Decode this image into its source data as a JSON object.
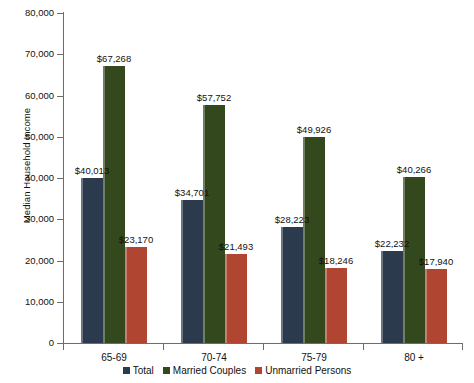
{
  "chart_data": {
    "type": "bar",
    "title": "",
    "xlabel": "",
    "ylabel": "Median Household Income",
    "categories": [
      "65-69",
      "70-74",
      "75-79",
      "80 +"
    ],
    "ylim": [
      0,
      80000
    ],
    "ytick_values": [
      0,
      10000,
      20000,
      30000,
      40000,
      50000,
      60000,
      70000,
      80000
    ],
    "ytick_labels": [
      "0",
      "10,000",
      "20,000",
      "30,000",
      "40,000",
      "50,000",
      "60,000",
      "70,000",
      "80,000"
    ],
    "grid": false,
    "legend_position": "bottom",
    "series": [
      {
        "name": "Total",
        "color": "#2c3a4d",
        "values": [
          40013,
          34701,
          28223,
          22232
        ],
        "labels": [
          "$40,013",
          "$34,701",
          "$28,223",
          "$22,232"
        ]
      },
      {
        "name": "Married Couples",
        "color": "#34481e",
        "values": [
          67268,
          57752,
          49926,
          40266
        ],
        "labels": [
          "$67,268",
          "$57,752",
          "$49,926",
          "$40,266"
        ]
      },
      {
        "name": "Unmarried Persons",
        "color": "#b04532",
        "values": [
          23170,
          21493,
          18246,
          17940
        ],
        "labels": [
          "$23,170",
          "$21,493",
          "$18,246",
          "$17,940"
        ]
      }
    ]
  },
  "axis": {
    "y_title": "Median Household Income"
  },
  "legend": {
    "items": [
      {
        "label": "Total",
        "color": "#2c3a4d"
      },
      {
        "label": "Married Couples",
        "color": "#34481e"
      },
      {
        "label": "Unmarried Persons",
        "color": "#b04532"
      }
    ]
  }
}
